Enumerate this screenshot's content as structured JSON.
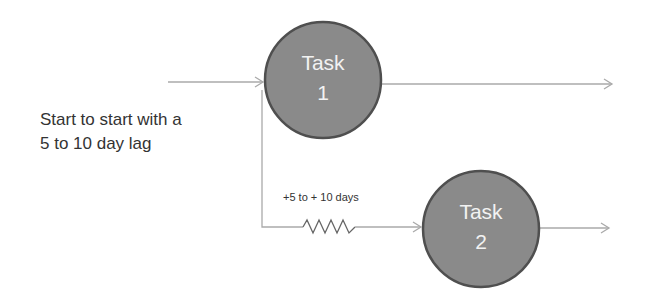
{
  "caption": {
    "line1": "Start to start with a",
    "line2": "5 to 10 day lag"
  },
  "lag_label": "+5 to + 10 days",
  "nodes": [
    {
      "line1": "Task",
      "line2": "1"
    },
    {
      "line1": "Task",
      "line2": "2"
    }
  ],
  "colors": {
    "node_fill": "#8a8a8a",
    "node_stroke": "#4f4f4f",
    "line": "#aaaaaa",
    "node_text": "#f2f2f2"
  }
}
